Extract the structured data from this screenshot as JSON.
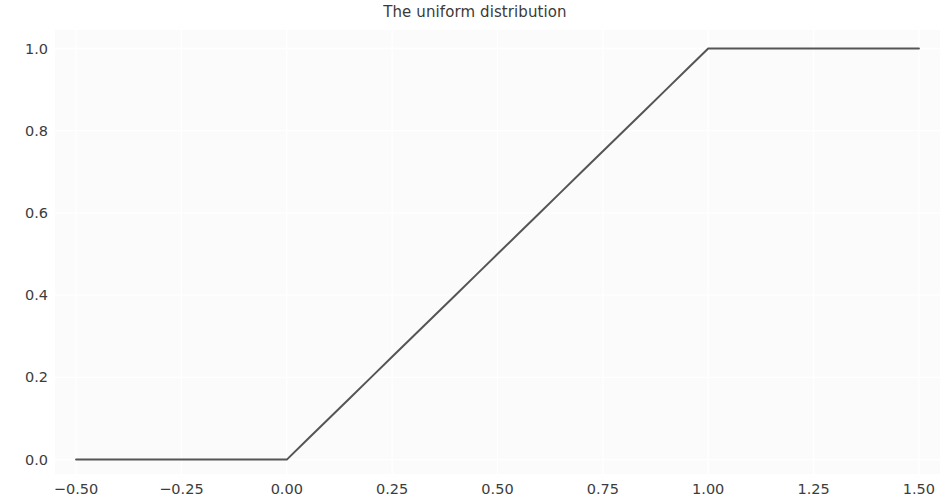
{
  "figure": {
    "width": 950,
    "height": 504,
    "background_color": "#ffffff",
    "plot_background_color": "#fbfbfc",
    "grid_color": "#ffffff",
    "tick_label_color": "#3c3c3c",
    "title_color": "#3a3a3a"
  },
  "chart_data": {
    "type": "line",
    "title": "The uniform distribution",
    "xlabel": "",
    "ylabel": "",
    "xlim": [
      -0.55,
      1.55
    ],
    "ylim": [
      -0.035,
      1.045
    ],
    "grid": true,
    "legend": null,
    "line_color": "#555555",
    "line_width": 2.0,
    "x_ticks": [
      -0.5,
      -0.25,
      0.0,
      0.25,
      0.5,
      0.75,
      1.0,
      1.25,
      1.5
    ],
    "x_tick_labels": [
      "−0.50",
      "−0.25",
      "0.00",
      "0.25",
      "0.50",
      "0.75",
      "1.00",
      "1.25",
      "1.50"
    ],
    "y_ticks": [
      0.0,
      0.2,
      0.4,
      0.6,
      0.8,
      1.0
    ],
    "y_tick_labels": [
      "0.0",
      "0.2",
      "0.4",
      "0.6",
      "0.8",
      "1.0"
    ],
    "series": [
      {
        "name": "uniform CDF",
        "x": [
          -0.5,
          -0.45,
          -0.4,
          -0.35,
          -0.3,
          -0.25,
          -0.2,
          -0.15,
          -0.1,
          -0.05,
          0.0,
          0.05,
          0.1,
          0.15,
          0.2,
          0.25,
          0.3,
          0.35,
          0.4,
          0.45,
          0.5,
          0.55,
          0.6,
          0.65,
          0.7,
          0.75,
          0.8,
          0.85,
          0.9,
          0.95,
          1.0,
          1.05,
          1.1,
          1.15,
          1.2,
          1.25,
          1.3,
          1.35,
          1.4,
          1.45,
          1.5
        ],
        "y": [
          0.0,
          0.0,
          0.0,
          0.0,
          0.0,
          0.0,
          0.0,
          0.0,
          0.0,
          0.0,
          0.0,
          0.05,
          0.1,
          0.15,
          0.2,
          0.25,
          0.3,
          0.35,
          0.4,
          0.45,
          0.5,
          0.55,
          0.6,
          0.65,
          0.7,
          0.75,
          0.8,
          0.85,
          0.9,
          0.95,
          1.0,
          1.0,
          1.0,
          1.0,
          1.0,
          1.0,
          1.0,
          1.0,
          1.0,
          1.0,
          1.0
        ]
      }
    ]
  }
}
